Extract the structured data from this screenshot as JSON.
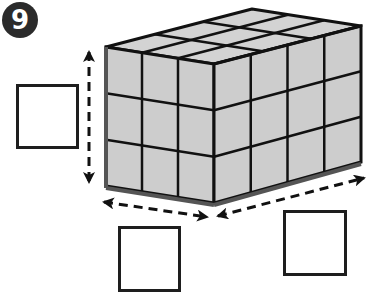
{
  "problem": {
    "number": "9",
    "badge_color": "#2b2b2b"
  },
  "figure": {
    "type": "rectangular-prism-of-unit-cubes",
    "dimensions": {
      "length": 4,
      "width": 3,
      "height": 3
    },
    "face_color": "#cfcfcf",
    "edge_color": "#111111",
    "base_edge_color": "#555555"
  },
  "answer_boxes": [
    {
      "id": "height",
      "value": ""
    },
    {
      "id": "width",
      "value": ""
    },
    {
      "id": "length",
      "value": ""
    }
  ]
}
